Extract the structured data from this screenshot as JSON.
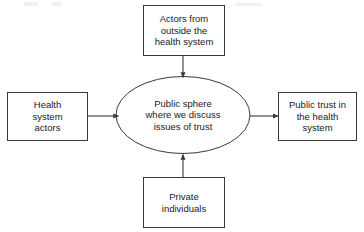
{
  "diagram": {
    "background_color": "#ffffff",
    "stroke_color": "#3a3a3a",
    "text_color": "#1a1a1a",
    "nodes": [
      {
        "id": "actors-outside",
        "shape": "rectangle",
        "label": "Actors from\noutside the\nhealth system",
        "position": "top"
      },
      {
        "id": "health-system-actors",
        "shape": "rectangle",
        "label": "Health\nsystem\nactors",
        "position": "left"
      },
      {
        "id": "public-sphere",
        "shape": "ellipse",
        "label": "Public sphere\nwhere we discuss\nissues of trust",
        "position": "center"
      },
      {
        "id": "public-trust",
        "shape": "rectangle",
        "label": "Public trust in\nthe health\nsystem",
        "position": "right"
      },
      {
        "id": "private-individuals",
        "shape": "rectangle",
        "label": "Private\nindividuals",
        "position": "bottom"
      }
    ],
    "edges": [
      {
        "id": "edge-actors-outside-to-public-sphere",
        "from": "actors-outside",
        "to": "public-sphere",
        "direction": "down",
        "arrowhead": "filled-triangle"
      },
      {
        "id": "edge-health-system-actors-to-public-sphere",
        "from": "health-system-actors",
        "to": "public-sphere",
        "direction": "right",
        "arrowhead": "filled-triangle"
      },
      {
        "id": "edge-private-individuals-to-public-sphere",
        "from": "private-individuals",
        "to": "public-sphere",
        "direction": "up",
        "arrowhead": "filled-triangle"
      },
      {
        "id": "edge-public-sphere-to-public-trust",
        "from": "public-sphere",
        "to": "public-trust",
        "direction": "right",
        "arrowhead": "filled-triangle"
      }
    ]
  }
}
